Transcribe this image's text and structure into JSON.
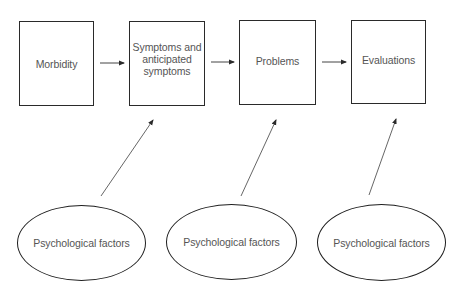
{
  "diagram": {
    "colors": {
      "box_border": "#2a2a2a",
      "text": "#555555",
      "arrow": "#444444",
      "background": "#ffffff"
    },
    "boxes": [
      {
        "id": "morbidity",
        "label": "Morbidity"
      },
      {
        "id": "symptoms",
        "label": "Symptoms and anticipated symptoms"
      },
      {
        "id": "problems",
        "label": "Problems"
      },
      {
        "id": "evaluations",
        "label": "Evaluations"
      }
    ],
    "factors": [
      {
        "id": "factor-1",
        "label": "Psychological factors",
        "points_to": "symptoms"
      },
      {
        "id": "factor-2",
        "label": "Psychological factors",
        "points_to": "problems"
      },
      {
        "id": "factor-3",
        "label": "Psychological factors",
        "points_to": "evaluations"
      }
    ],
    "flow_edges": [
      {
        "from": "morbidity",
        "to": "symptoms"
      },
      {
        "from": "symptoms",
        "to": "problems"
      },
      {
        "from": "problems",
        "to": "evaluations"
      }
    ]
  }
}
